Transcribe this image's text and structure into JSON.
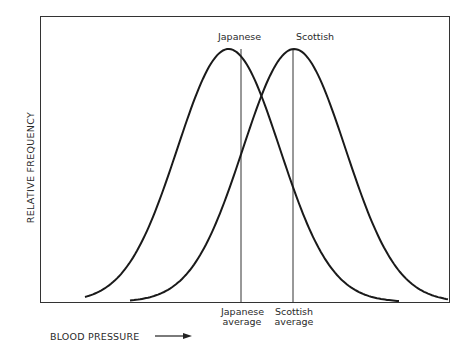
{
  "chart_data": {
    "type": "line",
    "title": "",
    "xlabel": "BLOOD PRESSURE",
    "ylabel": "RELATIVE FREQUENCY",
    "grid": false,
    "legend": "none (inline labels above peaks)",
    "series": [
      {
        "name": "Japanese",
        "distribution": "normal",
        "mean_rel": 0.46,
        "sd_rel": 0.125,
        "peak": 1.0
      },
      {
        "name": "Scottish",
        "distribution": "normal",
        "mean_rel": 0.62,
        "sd_rel": 0.125,
        "peak": 1.0
      }
    ],
    "annotations": [
      {
        "text": "Japanese average",
        "at": "Japanese mean (vertical line)"
      },
      {
        "text": "Scottish average",
        "at": "Scottish mean (vertical line)"
      }
    ]
  },
  "labels": {
    "japanese_peak": "Japanese",
    "scottish_peak": "Scottish",
    "japanese_avg_line1": "Japanese",
    "japanese_avg_line2": "average",
    "scottish_avg_line1": "Scottish",
    "scottish_avg_line2": "average",
    "x_axis": "BLOOD PRESSURE",
    "y_axis": "RELATIVE FREQUENCY"
  },
  "colors": {
    "line": "#1a1a1a",
    "frame": "#333333",
    "background": "#ffffff"
  }
}
